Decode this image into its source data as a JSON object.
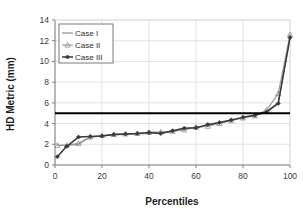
{
  "chart_data": {
    "type": "line",
    "title": "",
    "xlabel": "Percentiles",
    "ylabel": "HD Metric (mm)",
    "xlim": [
      0,
      100
    ],
    "ylim": [
      0,
      14
    ],
    "xticks": [
      0,
      20,
      40,
      60,
      80,
      100
    ],
    "yticks": [
      0,
      2,
      4,
      6,
      8,
      10,
      12,
      14
    ],
    "grid": true,
    "legend_position": "upper-left-inside",
    "series": [
      {
        "name": "Case I",
        "color": "#8c8c8c",
        "marker": "none",
        "x": [
          1,
          5,
          10,
          15,
          20,
          25,
          30,
          35,
          40,
          45,
          50,
          55,
          60,
          65,
          70,
          75,
          80,
          85,
          90,
          95,
          100
        ],
        "values": [
          1.9,
          1.9,
          2.0,
          2.7,
          2.8,
          2.9,
          2.95,
          3.0,
          3.05,
          3.1,
          3.2,
          3.5,
          3.6,
          3.8,
          4.1,
          4.3,
          4.6,
          4.8,
          5.2,
          6.0,
          12.3
        ]
      },
      {
        "name": "Case II",
        "color": "#9a9a9a",
        "marker": "triangle",
        "x": [
          1,
          5,
          10,
          15,
          20,
          25,
          30,
          35,
          40,
          45,
          50,
          55,
          60,
          65,
          70,
          75,
          80,
          85,
          90,
          95,
          100
        ],
        "values": [
          1.9,
          1.9,
          2.1,
          2.7,
          2.85,
          2.95,
          3.0,
          3.05,
          3.15,
          3.2,
          3.25,
          3.4,
          3.65,
          3.75,
          4.0,
          4.3,
          4.55,
          4.75,
          5.3,
          6.9,
          12.6
        ]
      },
      {
        "name": "Case III",
        "color": "#3a3a3a",
        "marker": "diamond",
        "x": [
          1,
          5,
          10,
          15,
          20,
          25,
          30,
          35,
          40,
          45,
          50,
          55,
          60,
          65,
          70,
          75,
          80,
          85,
          90,
          95,
          100
        ],
        "values": [
          0.8,
          1.8,
          2.7,
          2.75,
          2.8,
          2.95,
          3.0,
          3.05,
          3.15,
          3.05,
          3.3,
          3.55,
          3.6,
          3.9,
          4.1,
          4.35,
          4.6,
          4.8,
          5.1,
          5.95,
          12.3
        ]
      }
    ],
    "threshold_line": {
      "name": "threshold",
      "y": 5,
      "color": "#000000"
    }
  },
  "legend": {
    "items": [
      {
        "label": "Case I"
      },
      {
        "label": "Case II"
      },
      {
        "label": "Case III"
      }
    ]
  },
  "axes": {
    "x_title": "Percentiles",
    "y_title": "HD Metric (mm)",
    "x_tick_labels": [
      "0",
      "20",
      "40",
      "60",
      "80",
      "100"
    ],
    "y_tick_labels": [
      "0",
      "2",
      "4",
      "6",
      "8",
      "10",
      "12",
      "14"
    ]
  },
  "colors": {
    "grid": "#d9d9d9",
    "axis": "#808080",
    "background": "#ffffff",
    "threshold": "#000000"
  }
}
